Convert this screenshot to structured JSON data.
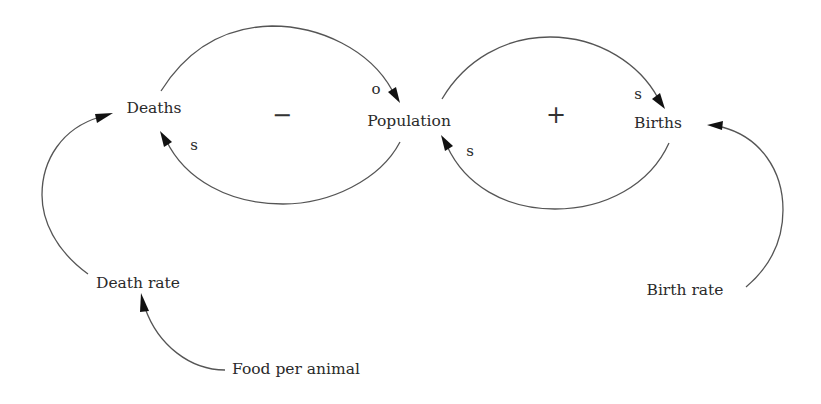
{
  "diagram": {
    "type": "causal-loop",
    "colors": {
      "background": "#ffffff",
      "line": "#555555",
      "text": "#2a2a2a",
      "arrowhead": "#111111"
    },
    "nodes": {
      "deaths": "Deaths",
      "population": "Population",
      "births": "Births",
      "death_rate": "Death rate",
      "birth_rate": "Birth rate",
      "food_per_animal": "Food per animal"
    },
    "links": [
      {
        "from": "Deaths",
        "to": "Population",
        "polarity": "o"
      },
      {
        "from": "Population",
        "to": "Deaths",
        "polarity": "s"
      },
      {
        "from": "Population",
        "to": "Births",
        "polarity": "s"
      },
      {
        "from": "Births",
        "to": "Population",
        "polarity": "s"
      },
      {
        "from": "Death rate",
        "to": "Deaths",
        "polarity": ""
      },
      {
        "from": "Birth rate",
        "to": "Births",
        "polarity": ""
      },
      {
        "from": "Food per animal",
        "to": "Death rate",
        "polarity": ""
      }
    ],
    "polarity_labels": {
      "deaths_to_population": "o",
      "population_to_deaths": "s",
      "population_to_births": "s",
      "births_to_population": "s"
    },
    "loops": {
      "balancing": "−",
      "reinforcing": "+"
    }
  }
}
